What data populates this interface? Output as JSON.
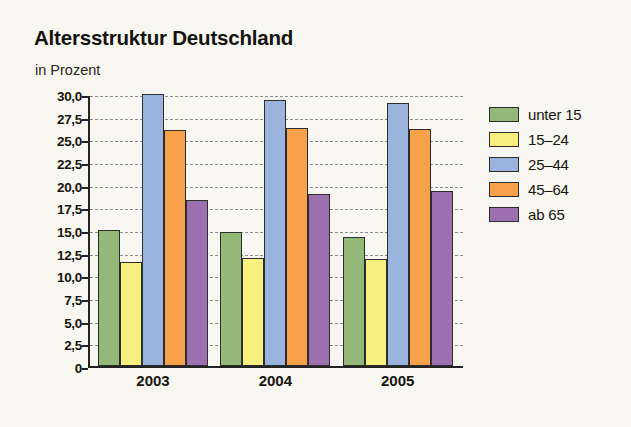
{
  "chart_data": {
    "type": "bar",
    "title": "Altersstruktur Deutschland",
    "subtitle": "in Prozent",
    "xlabel": "",
    "ylabel": "",
    "categories": [
      "2003",
      "2004",
      "2005"
    ],
    "series": [
      {
        "name": "unter 15",
        "color": "#93b877",
        "values": [
          15.0,
          14.8,
          14.2
        ]
      },
      {
        "name": "15–24",
        "color": "#f7f07e",
        "values": [
          11.5,
          11.9,
          11.8
        ]
      },
      {
        "name": "25–44",
        "color": "#9ab4dd",
        "values": [
          30.0,
          29.3,
          29.0
        ]
      },
      {
        "name": "45–64",
        "color": "#f7a24a",
        "values": [
          26.0,
          26.2,
          26.1
        ]
      },
      {
        "name": "ab 65",
        "color": "#9c6fae",
        "values": [
          18.3,
          19.0,
          19.3
        ]
      }
    ],
    "ylim": [
      0,
      30
    ],
    "ytick_values": [
      0,
      2.5,
      5,
      7.5,
      10,
      12.5,
      15,
      17.5,
      20,
      22.5,
      25,
      27.5,
      30
    ],
    "ytick_labels": [
      "0",
      "2,5",
      "5,0",
      "7,5",
      "10,0",
      "12,5",
      "15,0",
      "17,5",
      "20,0",
      "22,5",
      "25,0",
      "27,5",
      "30,0"
    ],
    "grid": true,
    "grid_style": "dashed",
    "legend_position": "right",
    "background_color": "#f8f6f0",
    "axis_color": "#232323"
  }
}
